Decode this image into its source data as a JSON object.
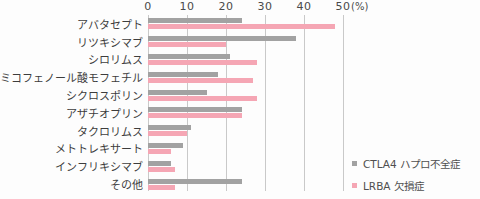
{
  "chart_data": {
    "type": "bar",
    "orientation": "horizontal",
    "title": "",
    "xlabel": "",
    "ylabel": "",
    "unit_label": "(%)",
    "x_ticks": [
      0,
      10,
      20,
      30,
      40,
      50
    ],
    "xlim": [
      0,
      50
    ],
    "grid": true,
    "legend_position": "bottom-right",
    "categories": [
      "アバタセプト",
      "リツキシマブ",
      "シロリムス",
      "ミコフェノール酸モフェチル",
      "シクロスポリン",
      "アザチオプリン",
      "タクロリムス",
      "メトトレキサート",
      "インフリキシマブ",
      "その他"
    ],
    "series": [
      {
        "name": "CTLA4 ハプロ不全症",
        "key": "ctla4-haploinsufficiency",
        "color": "#a2a2a2",
        "values": [
          24,
          38,
          21,
          18,
          15,
          24,
          11,
          9,
          6,
          24
        ]
      },
      {
        "name": "LRBA 欠損症",
        "key": "lrba-deficiency",
        "color": "#f5a6b4",
        "values": [
          48,
          20,
          28,
          27,
          28,
          24,
          10,
          6,
          7,
          7
        ]
      }
    ],
    "colors": {
      "gridline": "#c9c9c9",
      "text": "#3d3d3d"
    }
  }
}
